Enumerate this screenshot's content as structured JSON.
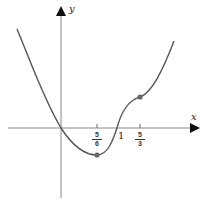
{
  "figure": {
    "x_axis_label": "x",
    "y_axis_label": "y",
    "tick_labels": {
      "five_sixths": {
        "num": "5",
        "den": "6"
      },
      "one": "1",
      "five_thirds": {
        "num": "5",
        "den": "3"
      }
    },
    "colors": {
      "curve": "#555555",
      "axes": "#777777",
      "points": "#666666",
      "background": "#ffffff"
    },
    "marked_points": [
      {
        "label": "local minimum",
        "x": "5/6"
      },
      {
        "label": "inflection point",
        "x": "5/3"
      }
    ]
  }
}
